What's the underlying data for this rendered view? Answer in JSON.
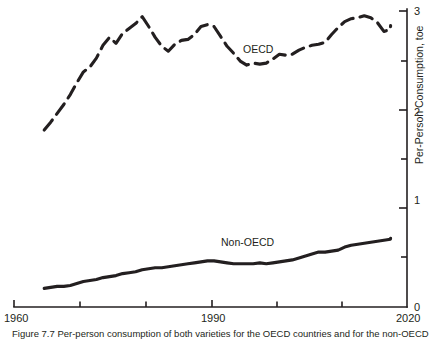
{
  "chart_data": {
    "type": "line",
    "title": "",
    "xlabel": "",
    "ylabel": "Per-Person Consumption, toe",
    "xlim": [
      1960,
      2020
    ],
    "ylim": [
      0,
      3.05
    ],
    "grid": false,
    "legend_position": "inline-annotations",
    "x_ticks_major": [
      1960,
      1990,
      2020
    ],
    "x_ticks_major_labels": [
      "1960",
      "1990",
      "2020"
    ],
    "x_ticks_minor": [
      1970,
      1980,
      2000,
      2010
    ],
    "y_ticks_major": [
      0,
      1,
      2,
      3
    ],
    "y_ticks_major_labels": [
      "0",
      "1",
      "2",
      "3"
    ],
    "y_ticks_minor": [
      0.5,
      1.5,
      2.5
    ],
    "y_axis_side": "right",
    "series": [
      {
        "name": "OECD",
        "style": "dashed",
        "annotation": "OECD",
        "x": [
          1964,
          1965,
          1966,
          1967,
          1968,
          1969,
          1970,
          1971,
          1972,
          1973,
          1974,
          1975,
          1976,
          1977,
          1978,
          1979,
          1980,
          1981,
          1982,
          1983,
          1984,
          1985,
          1986,
          1987,
          1988,
          1989,
          1990,
          1991,
          1992,
          1993,
          1994,
          1995,
          1996,
          1997,
          1998,
          1999,
          2000,
          2001,
          2002,
          2003,
          2004,
          2005,
          2006,
          2007,
          2008,
          2009,
          2010,
          2011,
          2012,
          2013,
          2014,
          2015,
          2016,
          2017,
          2018
        ],
        "y": [
          1.8,
          1.88,
          1.97,
          2.06,
          2.16,
          2.28,
          2.39,
          2.44,
          2.53,
          2.66,
          2.74,
          2.68,
          2.78,
          2.83,
          2.88,
          2.95,
          2.86,
          2.75,
          2.66,
          2.61,
          2.68,
          2.72,
          2.73,
          2.78,
          2.86,
          2.88,
          2.86,
          2.76,
          2.66,
          2.59,
          2.51,
          2.47,
          2.49,
          2.48,
          2.49,
          2.53,
          2.58,
          2.57,
          2.58,
          2.62,
          2.65,
          2.67,
          2.68,
          2.7,
          2.78,
          2.85,
          2.91,
          2.94,
          2.95,
          2.97,
          2.95,
          2.9,
          2.81,
          2.83,
          2.87
        ]
      },
      {
        "name": "Non-OECD",
        "style": "solid",
        "annotation": "Non-OECD",
        "x": [
          1964,
          1965,
          1966,
          1967,
          1968,
          1969,
          1970,
          1971,
          1972,
          1973,
          1974,
          1975,
          1976,
          1977,
          1978,
          1979,
          1980,
          1981,
          1982,
          1983,
          1984,
          1985,
          1986,
          1987,
          1988,
          1989,
          1990,
          1991,
          1992,
          1993,
          1994,
          1995,
          1996,
          1997,
          1998,
          1999,
          2000,
          2001,
          2002,
          2003,
          2004,
          2005,
          2006,
          2007,
          2008,
          2009,
          2010,
          2011,
          2012,
          2013,
          2014,
          2015,
          2016,
          2017,
          2018
        ],
        "y": [
          0.19,
          0.2,
          0.21,
          0.21,
          0.22,
          0.24,
          0.26,
          0.27,
          0.28,
          0.3,
          0.31,
          0.32,
          0.34,
          0.35,
          0.36,
          0.38,
          0.39,
          0.4,
          0.4,
          0.41,
          0.42,
          0.43,
          0.44,
          0.45,
          0.46,
          0.47,
          0.47,
          0.46,
          0.45,
          0.44,
          0.44,
          0.44,
          0.44,
          0.45,
          0.44,
          0.45,
          0.46,
          0.47,
          0.48,
          0.5,
          0.52,
          0.54,
          0.56,
          0.56,
          0.57,
          0.58,
          0.61,
          0.63,
          0.64,
          0.65,
          0.66,
          0.67,
          0.68,
          0.69,
          0.7
        ]
      }
    ],
    "annotations": [
      {
        "text": "OECD",
        "x": 1995,
        "y": 2.63
      },
      {
        "text": "Non-OECD",
        "x": 1992,
        "y": 0.7
      }
    ]
  },
  "axis": {
    "y_label": "Per-Person Consumption, toe",
    "x_labels": {
      "start": "1960",
      "middle": "1990",
      "end": "2020"
    },
    "y_labels": {
      "zero": "0",
      "one": "1",
      "two": "2",
      "three": "3"
    }
  },
  "labels": {
    "oecd": "OECD",
    "non_oecd": "Non-OECD"
  },
  "caption": {
    "text": "Figure 7.7 Per-person consumption of both varieties for the OECD countries and for the non-OECD"
  }
}
